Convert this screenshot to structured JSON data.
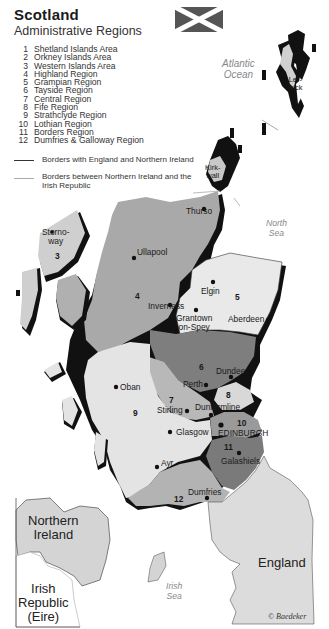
{
  "header": {
    "title": "Scotland",
    "subtitle": "Administrative Regions"
  },
  "legend": {
    "regions": [
      {
        "num": "1",
        "label": "Shetland Islands Area"
      },
      {
        "num": "2",
        "label": "Orkney Islands Area"
      },
      {
        "num": "3",
        "label": "Western Islands Area"
      },
      {
        "num": "4",
        "label": "Highland Region"
      },
      {
        "num": "5",
        "label": "Grampian Region"
      },
      {
        "num": "6",
        "label": "Tayside Region"
      },
      {
        "num": "7",
        "label": "Central Region"
      },
      {
        "num": "8",
        "label": "Fife Region"
      },
      {
        "num": "9",
        "label": "Strathclyde Region"
      },
      {
        "num": "10",
        "label": "Lothian Region"
      },
      {
        "num": "11",
        "label": "Borders Region"
      },
      {
        "num": "12",
        "label": "Dumfries & Galloway Region"
      }
    ],
    "borders": [
      {
        "label": "Borders with England and Northern Ireland",
        "color": "#333333"
      },
      {
        "label": "Borders between Northern Ireland and the Irish Republic",
        "color": "#aaaaaa"
      }
    ]
  },
  "map": {
    "flag": "Saltire (Scottish flag)",
    "colors": {
      "highland": "#a9a9a9",
      "grampian": "#e9e9e9",
      "tayside": "#7e7e7e",
      "central": "#b8b8b8",
      "fife": "#d8d8d8",
      "strathclyde": "#e4e4e4",
      "lothian": "#9a9a9a",
      "borders": "#7a7a7a",
      "dumfries_galloway": "#b3b3b3",
      "england": "#dcdcdc",
      "ireland": "#d4d4d4",
      "shadow": "#111111"
    },
    "seas": {
      "atlantic": [
        "Atlantic",
        "Ocean"
      ],
      "north": [
        "North",
        "Sea"
      ],
      "irish": [
        "Irish",
        "Sea"
      ]
    },
    "countries": {
      "northern_ireland": [
        "Northern",
        "Ireland"
      ],
      "irish_republic": [
        "Irish",
        "Republic",
        "(Eire)"
      ],
      "england": "England"
    },
    "region_numbers": {
      "r3": "3",
      "r4": "4",
      "r5": "5",
      "r6": "6",
      "r7": "7",
      "r8": "8",
      "r9": "9",
      "r10": "10",
      "r11": "11",
      "r12": "12"
    },
    "cities": {
      "lerwick": [
        "Ler-",
        "wick"
      ],
      "kirkwall": [
        "Kirk-",
        "wall"
      ],
      "thurso": "Thurso",
      "stornoway": [
        "Storno-",
        "way"
      ],
      "ullapool": "Ullapool",
      "elgin": "Elgin",
      "inverness": "Inverness",
      "grantown": [
        "Grantown",
        "on-Spey"
      ],
      "aberdeen": "Aberdeen",
      "dundee": "Dundee",
      "perth": "Perth",
      "oban": "Oban",
      "stirling": "Stirling",
      "dunfermline": "Dunfermline",
      "glasgow": "Glasgow",
      "edinburgh": "EDINBURGH",
      "galashiels": "Galashiels",
      "ayr": "Ayr",
      "dumfries": "Dumfries"
    },
    "copyright": "© Baedeker"
  }
}
